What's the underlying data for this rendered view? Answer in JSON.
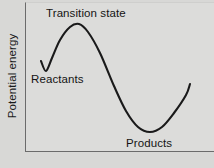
{
  "chart_data": {
    "type": "line",
    "title": "",
    "subtitle": "",
    "xlabel": "",
    "ylabel": "Potential energy",
    "grid": false,
    "legend": null,
    "axis_ticks": {
      "x": [],
      "y": []
    },
    "xlim": [
      0,
      189
    ],
    "ylim": [
      0,
      150
    ],
    "annotations": [
      {
        "name": "transition-state",
        "text": "Transition state",
        "x": 53,
        "y": 12
      },
      {
        "name": "reactants",
        "text": "Reactants",
        "x": 30,
        "y": 79
      },
      {
        "name": "products",
        "text": "Products",
        "x": 148,
        "y": 142
      }
    ],
    "series": [
      {
        "name": "reaction-coordinate-energy",
        "color": "#1a1a1a",
        "points": [
          {
            "x": 15,
            "y": 58
          },
          {
            "x": 20,
            "y": 68
          },
          {
            "x": 26,
            "y": 55
          },
          {
            "x": 34,
            "y": 37
          },
          {
            "x": 44,
            "y": 24
          },
          {
            "x": 53,
            "y": 21
          },
          {
            "x": 62,
            "y": 29
          },
          {
            "x": 74,
            "y": 50
          },
          {
            "x": 88,
            "y": 83
          },
          {
            "x": 100,
            "y": 108
          },
          {
            "x": 112,
            "y": 124
          },
          {
            "x": 124,
            "y": 129
          },
          {
            "x": 136,
            "y": 124
          },
          {
            "x": 148,
            "y": 110
          },
          {
            "x": 160,
            "y": 92
          },
          {
            "x": 164,
            "y": 81
          }
        ]
      }
    ]
  },
  "axes": {
    "ylabel": "Potential energy"
  },
  "plot": {
    "labels": {
      "transition_state": "Transition state",
      "reactants": "Reactants",
      "products": "Products"
    }
  },
  "colors": {
    "background": "#d8d8d6",
    "plot_background": "#dcdcda",
    "curve": "#1a1a1a",
    "axis": "#6b6b6b",
    "text": "#141414"
  }
}
